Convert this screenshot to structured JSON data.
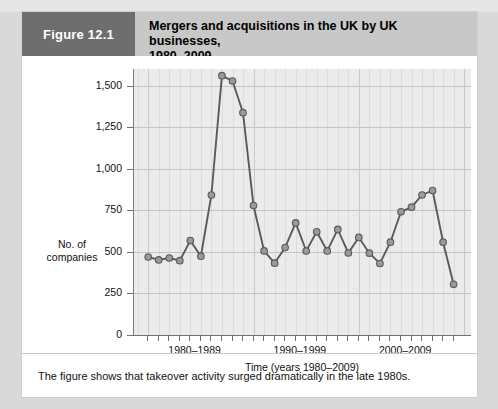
{
  "figure": {
    "number_label": "Figure 12.1",
    "title_line1": "Mergers and acquisitions in the UK by UK businesses,",
    "title_line2": "1980–2009",
    "note": "The figure shows that takeover activity surged dramatically in the late 1980s.",
    "header_bg": "#c8c8c8",
    "number_bg": "#6e6e6e",
    "plot_bg": "#ebebeb",
    "line_color": "#5a5a5a",
    "marker_fill": "#9a9a9a"
  },
  "chart_data": {
    "type": "line",
    "title": "Mergers and acquisitions in the UK by UK businesses, 1980–2009",
    "xlabel": "Time (years 1980–2009)",
    "ylabel": "No. of companies",
    "ylim": [
      0,
      1600
    ],
    "yticks": [
      0,
      250,
      500,
      750,
      1000,
      1250,
      1500
    ],
    "ytick_labels": [
      "0",
      "250",
      "500",
      "750",
      "1,000",
      "1,250",
      "1,500"
    ],
    "grid": true,
    "legend": "none",
    "x_category_labels": [
      "1980–1989",
      "1990–1999",
      "2000–2009"
    ],
    "x": [
      1980,
      1981,
      1982,
      1983,
      1984,
      1985,
      1986,
      1987,
      1988,
      1989,
      1990,
      1991,
      1992,
      1993,
      1994,
      1995,
      1996,
      1997,
      1998,
      1999,
      2000,
      2001,
      2002,
      2003,
      2004,
      2005,
      2006,
      2007,
      2008,
      2009
    ],
    "values": [
      469,
      452,
      463,
      447,
      568,
      474,
      842,
      1560,
      1528,
      1337,
      779,
      506,
      432,
      526,
      674,
      505,
      621,
      506,
      635,
      493,
      587,
      492,
      430,
      558,
      741,
      769,
      842,
      869,
      558,
      305
    ]
  },
  "axis_geometry": {
    "x_first_px": 147,
    "x_step_px": 10.7,
    "y_zero_px": 279,
    "y_px_per_unit": 0.1667
  }
}
